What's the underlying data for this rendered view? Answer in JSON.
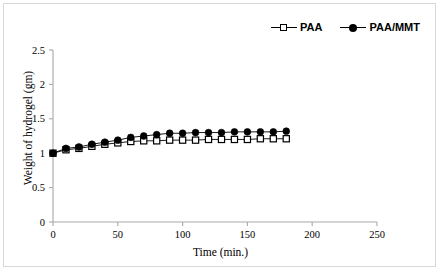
{
  "chart_data": {
    "type": "line",
    "title": "",
    "xlabel": "Time (min.)",
    "ylabel": "Weight of hydrogel (gm)",
    "xlim": [
      0,
      250
    ],
    "ylim": [
      0,
      2.5
    ],
    "xticks": [
      0,
      50,
      100,
      150,
      200,
      250
    ],
    "yticks": [
      0,
      0.5,
      1,
      1.5,
      2,
      2.5
    ],
    "xtick_labels": [
      "0",
      "50",
      "100",
      "150",
      "200",
      "250"
    ],
    "ytick_labels": [
      "0",
      "0.5",
      "1",
      "1.5",
      "2",
      "2.5"
    ],
    "grid": false,
    "legend_position": "top-right",
    "x": [
      0,
      10,
      20,
      30,
      40,
      50,
      60,
      70,
      80,
      90,
      100,
      110,
      120,
      130,
      140,
      150,
      160,
      170,
      180
    ],
    "series": [
      {
        "name": "PAA",
        "marker": "open-square",
        "color": "#000000",
        "values": [
          1.0,
          1.05,
          1.07,
          1.1,
          1.13,
          1.15,
          1.17,
          1.18,
          1.18,
          1.19,
          1.19,
          1.19,
          1.2,
          1.2,
          1.2,
          1.2,
          1.21,
          1.21,
          1.21
        ]
      },
      {
        "name": "PAA/MMT",
        "marker": "filled-circle",
        "color": "#000000",
        "values": [
          1.0,
          1.07,
          1.09,
          1.13,
          1.16,
          1.19,
          1.23,
          1.25,
          1.27,
          1.29,
          1.29,
          1.3,
          1.3,
          1.3,
          1.31,
          1.31,
          1.31,
          1.31,
          1.32
        ]
      }
    ]
  },
  "legend": {
    "entries": [
      {
        "label": "PAA"
      },
      {
        "label": "PAA/MMT"
      }
    ]
  },
  "axes": {
    "x_title": "Time (min.)",
    "y_title": "Weight of hydrogel (gm)"
  }
}
